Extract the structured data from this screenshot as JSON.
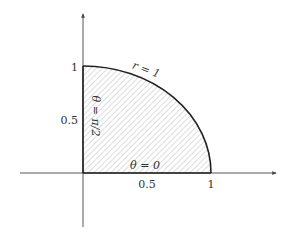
{
  "diagram": {
    "colors": {
      "axis": "#444444",
      "boundary": "#222222",
      "hatch": "#bbbbbb",
      "text": "#333333"
    },
    "axes": {
      "x_ticks": [
        {
          "value": 0.5,
          "label": "0.5"
        },
        {
          "value": 1,
          "label": "1"
        }
      ],
      "y_ticks": [
        {
          "value": 0.5,
          "label": "0.5"
        },
        {
          "value": 1,
          "label": "1"
        }
      ]
    },
    "region": {
      "shape": "quarter-disk",
      "fill": "hatched",
      "r_range": [
        0,
        1
      ],
      "theta_range": [
        "0",
        "π/2"
      ]
    },
    "annotations": {
      "arc": "r = 1",
      "bottom_edge": "θ = 0",
      "left_edge": "θ = π/2"
    }
  }
}
